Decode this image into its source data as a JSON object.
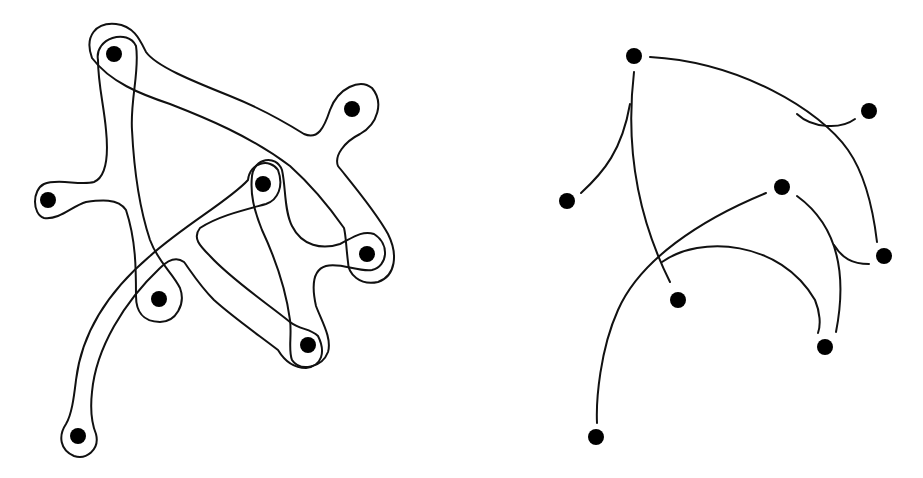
{
  "figure": {
    "colors": {
      "background": "#ffffff",
      "stroke": "#111111",
      "vertex": "#000000"
    },
    "left_panel": {
      "name": "subset-drawing",
      "vertices": [
        {
          "id": "a",
          "x": 114,
          "y": 54
        },
        {
          "id": "b",
          "x": 352,
          "y": 109
        },
        {
          "id": "c",
          "x": 48,
          "y": 200
        },
        {
          "id": "d",
          "x": 263,
          "y": 184
        },
        {
          "id": "e",
          "x": 367,
          "y": 254
        },
        {
          "id": "f",
          "x": 159,
          "y": 299
        },
        {
          "id": "g",
          "x": 308,
          "y": 345
        },
        {
          "id": "h",
          "x": 78,
          "y": 436
        }
      ],
      "hyperedges": [
        {
          "id": "E1",
          "members": [
            "a",
            "c",
            "f"
          ]
        },
        {
          "id": "E2",
          "members": [
            "a",
            "b",
            "e"
          ]
        },
        {
          "id": "E3",
          "members": [
            "d",
            "h",
            "g"
          ]
        },
        {
          "id": "E4",
          "members": [
            "d",
            "e",
            "g"
          ]
        }
      ]
    },
    "right_panel": {
      "name": "curve-drawing",
      "vertices": [
        {
          "id": "a",
          "x": 634,
          "y": 56
        },
        {
          "id": "b",
          "x": 869,
          "y": 111
        },
        {
          "id": "c",
          "x": 567,
          "y": 201
        },
        {
          "id": "d",
          "x": 782,
          "y": 187
        },
        {
          "id": "e",
          "x": 884,
          "y": 256
        },
        {
          "id": "f",
          "x": 678,
          "y": 300
        },
        {
          "id": "g",
          "x": 825,
          "y": 347
        },
        {
          "id": "h",
          "x": 596,
          "y": 437
        }
      ]
    }
  }
}
